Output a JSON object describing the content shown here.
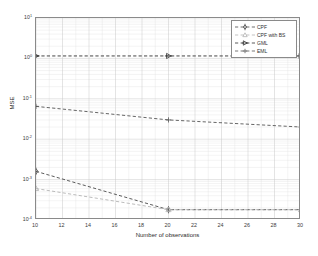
{
  "chart_data": {
    "type": "line",
    "title": "",
    "xlabel": "Number of observations",
    "ylabel": "MSE",
    "xscale": "linear",
    "yscale": "log",
    "xlim": [
      10,
      30
    ],
    "ylim": [
      0.0001,
      10
    ],
    "grid": true,
    "legend_position": "top-right",
    "x": [
      10,
      20,
      30
    ],
    "xticks": [
      10,
      12,
      14,
      16,
      18,
      20,
      22,
      24,
      26,
      28,
      30
    ],
    "xticklabels": [
      "10",
      "12",
      "14",
      "16",
      "18",
      "20",
      "22",
      "24",
      "26",
      "28",
      "30"
    ],
    "yticks": [
      10,
      1,
      0.1,
      0.01,
      0.001,
      0.0001
    ],
    "yticklabels": [
      "10^1",
      "10^0",
      "10^-1",
      "10^-2",
      "10^-3",
      "10^-4"
    ],
    "series": [
      {
        "name": "CPF",
        "marker": "diamond",
        "linestyle": "dashed",
        "color": "#4a4a4a",
        "values": [
          0.0016,
          0.00018,
          0.00018
        ]
      },
      {
        "name": "CPF with BS",
        "marker": "triangle-up",
        "linestyle": "dashed",
        "color": "#b4b4b4",
        "values": [
          0.0006,
          0.00018,
          0.00018
        ]
      },
      {
        "name": "GML",
        "marker": "triangle-right",
        "linestyle": "dashed",
        "color": "#303030",
        "values": [
          1.15,
          1.15,
          1.15
        ]
      },
      {
        "name": "EML",
        "marker": "plus",
        "linestyle": "dashed",
        "color": "#555555",
        "values": [
          0.065,
          0.03,
          0.02
        ]
      }
    ]
  },
  "axis": {
    "ylabel": "MSE",
    "xlabel": "Number of observations",
    "yticklabels": [
      {
        "mantissa": "10",
        "exp": "1"
      },
      {
        "mantissa": "10",
        "exp": "0"
      },
      {
        "mantissa": "10",
        "exp": "-1"
      },
      {
        "mantissa": "10",
        "exp": "-2"
      },
      {
        "mantissa": "10",
        "exp": "-3"
      },
      {
        "mantissa": "10",
        "exp": "-4"
      }
    ],
    "xticklabels": [
      "10",
      "12",
      "14",
      "16",
      "18",
      "20",
      "22",
      "24",
      "26",
      "28",
      "30"
    ]
  },
  "legend": {
    "items": [
      {
        "label": "CPF",
        "marker": "diamond",
        "color": "#4a4a4a"
      },
      {
        "label": "CPF with BS",
        "marker": "triangle-up",
        "color": "#b4b4b4"
      },
      {
        "label": "GML",
        "marker": "triangle-right",
        "color": "#303030"
      },
      {
        "label": "EML",
        "marker": "plus",
        "color": "#555555"
      }
    ]
  },
  "colors": {
    "frame": "#8a8a8a",
    "major_grid": "#c9c9c9",
    "minor_grid": "#e4e4e4",
    "background": "#ffffff"
  }
}
